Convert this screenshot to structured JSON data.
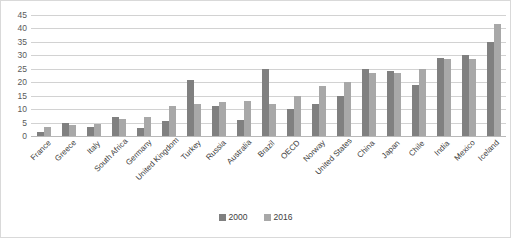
{
  "chart_data": {
    "type": "bar",
    "title": "",
    "subtitle": "",
    "xlabel": "",
    "ylabel": "",
    "ylim": [
      0,
      45
    ],
    "ytick_labels": [
      "45",
      "40",
      "35",
      "30",
      "25",
      "20",
      "15",
      "10",
      "5",
      "0"
    ],
    "ytick_values": [
      45,
      40,
      35,
      30,
      25,
      20,
      15,
      10,
      5,
      0
    ],
    "grid": true,
    "legend_position": "bottom",
    "categories": [
      "France",
      "Greece",
      "Italy",
      "South Africa",
      "Germany",
      "United Kingdom",
      "Turkey",
      "Russia",
      "Australia",
      "Brazil",
      "OECD",
      "Norway",
      "United States",
      "China",
      "Japan",
      "Chile",
      "India",
      "Mexico",
      "Iceland"
    ],
    "series": [
      {
        "name": "2000",
        "color": "#808080",
        "values": [
          1.5,
          5,
          3.5,
          7,
          3,
          5.5,
          21,
          11,
          6,
          25,
          10,
          12,
          15,
          25,
          24,
          19,
          29,
          30,
          35
        ]
      },
      {
        "name": "2016",
        "color": "#a8a8a8",
        "values": [
          3.5,
          4,
          4.5,
          6.5,
          7,
          11,
          12,
          12.5,
          13,
          12,
          15,
          18.5,
          20,
          23.5,
          23.5,
          25,
          28.5,
          28.5,
          41.5
        ]
      }
    ]
  },
  "legend": {
    "entries": [
      {
        "label": "2000",
        "color": "#808080"
      },
      {
        "label": "2016",
        "color": "#a8a8a8"
      }
    ]
  },
  "colors": {
    "series_2000": "#808080",
    "series_2016": "#a8a8a8",
    "gridline": "#d2d2d2",
    "border": "#d9d9d9",
    "background": "#ffffff",
    "axis_text": "#5a5a5a"
  }
}
